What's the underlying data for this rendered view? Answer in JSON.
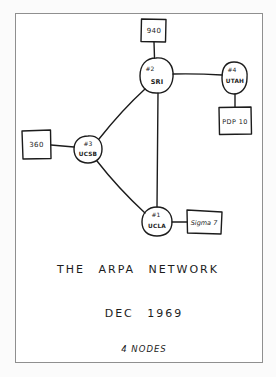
{
  "diagram": {
    "title": "THE ARPA NETWORK",
    "date": "DEC 1969",
    "node_count_label": "4 NODES",
    "imps": [
      {
        "id": "sri",
        "number": "#2",
        "site": "SRI"
      },
      {
        "id": "utah",
        "number": "#4",
        "site": "UTAH"
      },
      {
        "id": "ucsb",
        "number": "#3",
        "site": "UCSB"
      },
      {
        "id": "ucla",
        "number": "#1",
        "site": "UCLA"
      }
    ],
    "hosts": [
      {
        "id": "940",
        "label": "940",
        "attached_to": "SRI"
      },
      {
        "id": "pdp10",
        "label": "PDP 10",
        "attached_to": "UTAH"
      },
      {
        "id": "360",
        "label": "360",
        "attached_to": "UCSB"
      },
      {
        "id": "sigma7",
        "label": "Sigma 7",
        "attached_to": "UCLA"
      }
    ],
    "links": [
      [
        "SRI",
        "UTAH"
      ],
      [
        "SRI",
        "UCSB"
      ],
      [
        "SRI",
        "UCLA"
      ],
      [
        "UCSB",
        "UCLA"
      ]
    ],
    "colors": {
      "ink": "#1c1c1c",
      "paper": "#ffffff",
      "frame": "#8f8f8f",
      "background": "#fbfbfb"
    }
  }
}
